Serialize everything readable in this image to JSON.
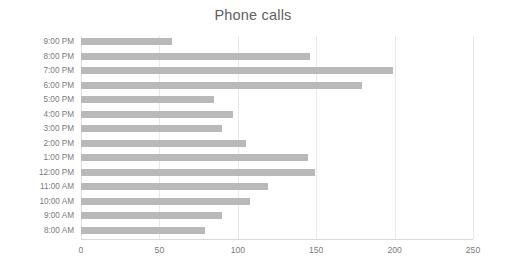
{
  "chart_data": {
    "type": "bar",
    "orientation": "horizontal",
    "title": "Phone calls",
    "xlabel": "",
    "ylabel": "",
    "categories": [
      "8:00 AM",
      "9:00 AM",
      "10:00 AM",
      "11:00 AM",
      "12:00 PM",
      "1:00 PM",
      "2:00 PM",
      "3:00 PM",
      "4:00 PM",
      "5:00 PM",
      "6:00 PM",
      "7:00 PM",
      "8:00 PM",
      "9:00 PM"
    ],
    "values": [
      79,
      90,
      108,
      119,
      149,
      145,
      105,
      90,
      97,
      85,
      179,
      199,
      146,
      58
    ],
    "categories_top_to_bottom": [
      "9:00 PM",
      "8:00 PM",
      "7:00 PM",
      "6:00 PM",
      "5:00 PM",
      "4:00 PM",
      "3:00 PM",
      "2:00 PM",
      "1:00 PM",
      "12:00 PM",
      "11:00 AM",
      "10:00 AM",
      "9:00 AM",
      "8:00 AM"
    ],
    "values_top_to_bottom": [
      58,
      146,
      199,
      179,
      85,
      97,
      90,
      105,
      145,
      149,
      119,
      108,
      90,
      79
    ],
    "xlim": [
      0,
      250
    ],
    "xticks": [
      0,
      50,
      100,
      150,
      200,
      250
    ],
    "xtick_labels": [
      "0",
      "50",
      "100",
      "150",
      "200",
      "250"
    ],
    "grid": "vertical",
    "legend": "none",
    "bar_color": "#b9b9b9",
    "gridline_color": "#e8e8e8",
    "axis_text_color": "#7a7a7a",
    "title_color": "#606060",
    "background_color": "#ffffff"
  }
}
